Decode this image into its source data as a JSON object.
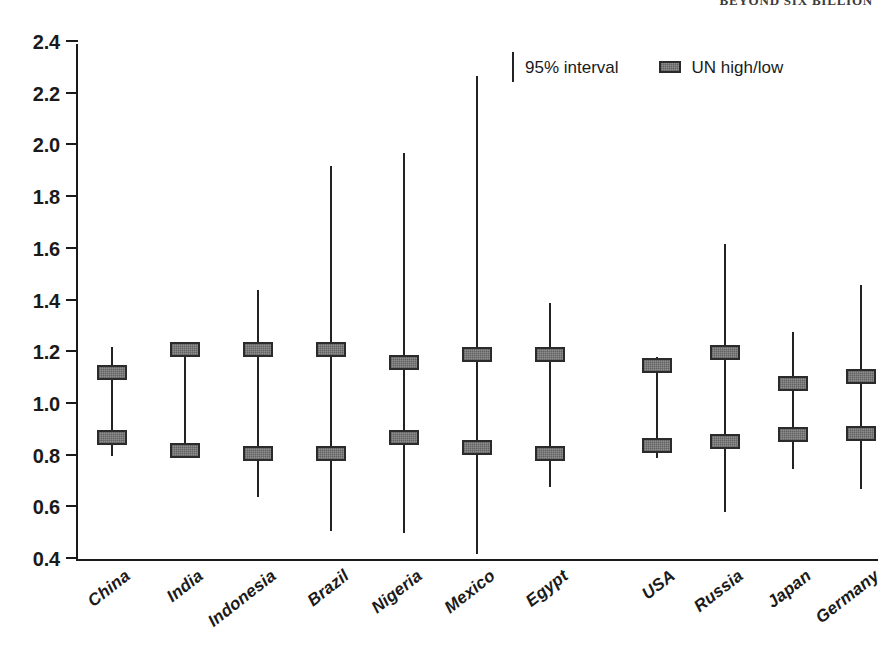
{
  "running_head": "BEYOND SIX BILLION",
  "legend": {
    "position": "top-center",
    "entries": [
      {
        "label": "95% interval",
        "marker": "vertical-line",
        "color": "#222222"
      },
      {
        "label": "UN high/low",
        "marker": "filled-rectangle",
        "color": "#8e8e8e"
      }
    ]
  },
  "axis": {
    "y_ticks": [
      "2.4",
      "2.2",
      "2.0",
      "1.8",
      "1.6",
      "1.4",
      "1.2",
      "1.0",
      "0.8",
      "0.6",
      "0.4"
    ]
  },
  "chart_data": {
    "type": "range",
    "title": "",
    "xlabel": "",
    "ylabel": "",
    "ylim": [
      0.4,
      2.4
    ],
    "ytick_values": [
      0.4,
      0.6,
      0.8,
      1.0,
      1.2,
      1.4,
      1.6,
      1.8,
      2.0,
      2.2,
      2.4
    ],
    "grid": false,
    "legend_position": "top-center",
    "categories": [
      "China",
      "India",
      "Indonesia",
      "Brazil",
      "Nigeria",
      "Mexico",
      "Egypt",
      "USA",
      "Russia",
      "Japan",
      "Germany",
      "France",
      "Australia"
    ],
    "group_gap_after": "Egypt",
    "series": [
      {
        "name": "95% interval",
        "type": "interval",
        "points": [
          {
            "category": "China",
            "low": 0.8,
            "high": 1.22
          },
          {
            "category": "India",
            "low": 0.79,
            "high": 1.23
          },
          {
            "category": "Indonesia",
            "low": 0.64,
            "high": 1.44
          },
          {
            "category": "Brazil",
            "low": 0.51,
            "high": 1.92
          },
          {
            "category": "Nigeria",
            "low": 0.5,
            "high": 1.97
          },
          {
            "category": "Mexico",
            "low": 0.42,
            "high": 2.27
          },
          {
            "category": "Egypt",
            "low": 0.68,
            "high": 1.39
          },
          {
            "category": "USA",
            "low": 0.79,
            "high": 1.18
          },
          {
            "category": "Russia",
            "low": 0.58,
            "high": 1.62
          },
          {
            "category": "Japan",
            "low": 0.75,
            "high": 1.28
          },
          {
            "category": "Germany",
            "low": 0.67,
            "high": 1.46
          },
          {
            "category": "France",
            "low": 0.76,
            "high": 1.24
          },
          {
            "category": "Australia",
            "low": 0.74,
            "high": 1.38
          }
        ]
      },
      {
        "name": "UN high/low",
        "type": "marker-pair",
        "points": [
          {
            "category": "China",
            "low": 0.87,
            "high": 1.12
          },
          {
            "category": "India",
            "low": 0.82,
            "high": 1.21
          },
          {
            "category": "Indonesia",
            "low": 0.81,
            "high": 1.21
          },
          {
            "category": "Brazil",
            "low": 0.81,
            "high": 1.21
          },
          {
            "category": "Nigeria",
            "low": 0.87,
            "high": 1.16
          },
          {
            "category": "Mexico",
            "low": 0.83,
            "high": 1.19
          },
          {
            "category": "Egypt",
            "low": 0.81,
            "high": 1.19
          },
          {
            "category": "USA",
            "low": 0.84,
            "high": 1.15
          },
          {
            "category": "Russia",
            "low": 0.855,
            "high": 1.2
          },
          {
            "category": "Japan",
            "low": 0.88,
            "high": 1.08
          },
          {
            "category": "Germany",
            "low": 0.885,
            "high": 1.105
          },
          {
            "category": "France",
            "low": 0.865,
            "high": 1.08
          },
          {
            "category": "Australia",
            "low": 0.765,
            "high": 1.06
          }
        ]
      }
    ]
  }
}
